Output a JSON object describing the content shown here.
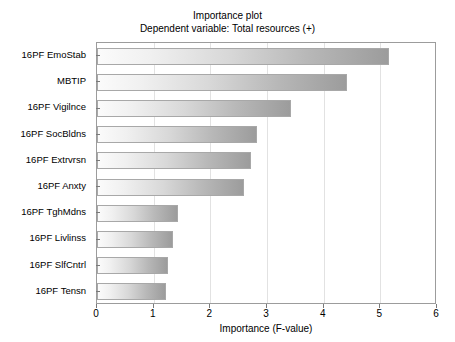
{
  "chart_data": {
    "type": "bar",
    "orientation": "horizontal",
    "title": "Importance plot",
    "subtitle": "Dependent variable: Total resources (+)",
    "xlabel": "Importance (F-value)",
    "ylabel": "",
    "xlim": [
      0,
      6
    ],
    "xticks": [
      0,
      1,
      2,
      3,
      4,
      5,
      6
    ],
    "xticklabels": [
      "0",
      "1",
      "2",
      "3",
      "4",
      "5",
      "6"
    ],
    "grid": "vertical",
    "legend": "none",
    "categories": [
      "16PF  EmoStab",
      "MBTIP",
      "16PF Vigilnce",
      "16PF  SocBldns",
      "16PF  Extrvrsn",
      "16PF Anxty",
      "16PF TghMdns",
      "16PF Livlinss",
      "16PF  SlfCntrl",
      "16PF  Tensn"
    ],
    "values": [
      5.15,
      4.41,
      3.42,
      2.82,
      2.72,
      2.59,
      1.43,
      1.34,
      1.25,
      1.22
    ],
    "bar_gradient_from": "#fbfbfb",
    "bar_gradient_to": "#9c9c9c",
    "bar_border_color": "#a8a8a8",
    "gridline_color": "#e2e2e2",
    "axis_color": "#9c9c9c",
    "background": "#ffffff"
  }
}
